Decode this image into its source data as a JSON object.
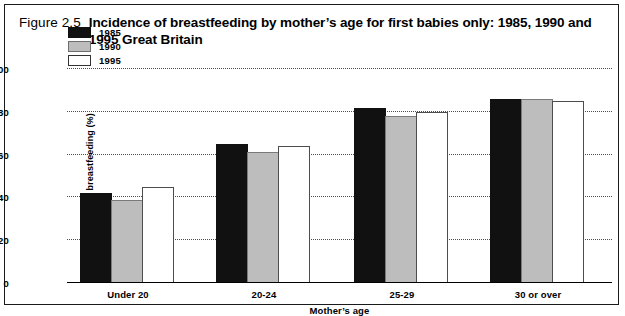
{
  "figure": {
    "label": "Figure 2.5",
    "title": "Incidence of breastfeeding by mother’s age for first babies only: 1985, 1990 and 1995 Great Britain"
  },
  "chart_data": {
    "type": "bar",
    "title": "Incidence of breastfeeding by mother’s age for first babies only: 1985, 1990 and 1995 Great Britain",
    "xlabel": "Mother’s age",
    "ylabel": "Incidence of breastfeeding (%)",
    "categories": [
      "Under 20",
      "20-24",
      "25-29",
      "30 or over"
    ],
    "series": [
      {
        "name": "1985",
        "color": "#111111",
        "values": [
          42,
          65,
          82,
          86
        ]
      },
      {
        "name": "1990",
        "color": "#bdbdbd",
        "values": [
          39,
          61,
          78,
          86
        ]
      },
      {
        "name": "1995",
        "color": "#ffffff",
        "values": [
          45,
          64,
          80,
          85
        ]
      }
    ],
    "ylim": [
      0,
      100
    ],
    "yticks": [
      0,
      20,
      40,
      60,
      80,
      100
    ],
    "grid": true,
    "grid_style": "dotted-horizontal",
    "legend_position": "upper-left-inside"
  }
}
